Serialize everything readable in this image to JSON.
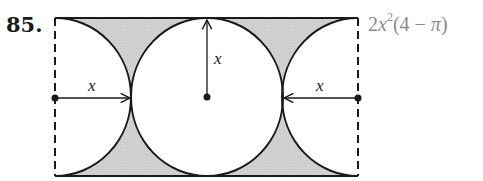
{
  "problem": {
    "number": "85.",
    "answer": {
      "coefficient": "2",
      "variable": "x",
      "exponent": "2",
      "factor_open": "(4 − ",
      "pi": "π",
      "factor_close": ")"
    }
  },
  "diagram": {
    "labels": {
      "left_radius": "x",
      "top_radius": "x",
      "right_radius": "x"
    },
    "colors": {
      "shade": "#cfcfcf",
      "stroke": "#1a1a1a"
    }
  }
}
